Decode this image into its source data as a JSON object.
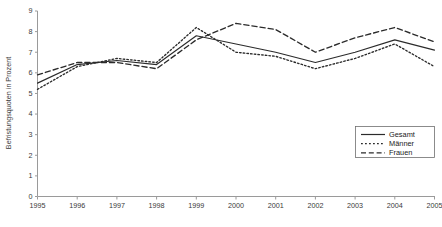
{
  "chart_data": {
    "type": "line",
    "title": "",
    "xlabel": "",
    "ylabel": "Befristungsquoten in Prozent",
    "x": [
      1995,
      1996,
      1997,
      1998,
      1999,
      2000,
      2001,
      2002,
      2003,
      2004,
      2005
    ],
    "xtick_labels": [
      "1995",
      "1996",
      "1997",
      "1998",
      "1999",
      "2000",
      "2001",
      "2002",
      "2003",
      "2004",
      "2005"
    ],
    "ytick_labels": [
      "0",
      "1",
      "2",
      "3",
      "4",
      "5",
      "6",
      "7",
      "8",
      "9"
    ],
    "ylim": [
      0,
      9
    ],
    "xlim": [
      1995,
      2005
    ],
    "grid": false,
    "legend_position": "bottom-right",
    "series": [
      {
        "name": "Gesamt",
        "style": "solid",
        "values": [
          5.5,
          6.4,
          6.6,
          6.4,
          7.8,
          7.4,
          7.0,
          6.5,
          7.0,
          7.6,
          7.1
        ]
      },
      {
        "name": "Männer",
        "style": "dotted",
        "values": [
          5.2,
          6.3,
          6.7,
          6.5,
          8.2,
          7.0,
          6.8,
          6.2,
          6.7,
          7.4,
          6.3
        ]
      },
      {
        "name": "Frauen",
        "style": "dashed",
        "values": [
          5.9,
          6.5,
          6.5,
          6.2,
          7.6,
          8.4,
          8.1,
          7.0,
          7.7,
          8.2,
          7.5
        ]
      }
    ]
  },
  "legend": {
    "items": [
      {
        "label": "Gesamt"
      },
      {
        "label": "Männer"
      },
      {
        "label": "Frauen"
      }
    ]
  },
  "colors": {
    "series_stroke": "#2b2b2b",
    "axis": "#9a9a9a",
    "text": "#1a1a1a",
    "background": "#ffffff"
  }
}
